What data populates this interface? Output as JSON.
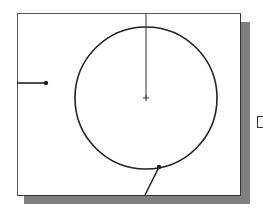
{
  "diagram": {
    "type": "cad-sketch",
    "colors": {
      "background": "#ffffff",
      "frame_border": "#444444",
      "shadow": "#7f7f7f",
      "stroke": "#222222"
    },
    "frame": {
      "x": 17,
      "y": 13,
      "width": 222,
      "height": 181
    },
    "shadow": {
      "x": 24,
      "y": 22,
      "width": 226,
      "height": 182
    },
    "circle": {
      "cx": 146,
      "cy": 98,
      "r": 71
    },
    "center_marker": {
      "x": 146,
      "y": 98,
      "size": 3
    },
    "vertical_line": {
      "x1": 146,
      "y1": 13,
      "x2": 146,
      "y2": 98
    },
    "left_line": {
      "x1": 17,
      "y1": 83,
      "x2": 46,
      "y2": 83
    },
    "left_point": {
      "x": 46,
      "y": 83,
      "r": 2
    },
    "circle_point": {
      "x": 159,
      "y": 167,
      "r": 2
    },
    "tangent_line": {
      "x1": 159,
      "y1": 167,
      "x2": 145,
      "y2": 195
    },
    "edge_glyph": {
      "label": "partial-bracket",
      "x": 257,
      "y": 116
    }
  }
}
